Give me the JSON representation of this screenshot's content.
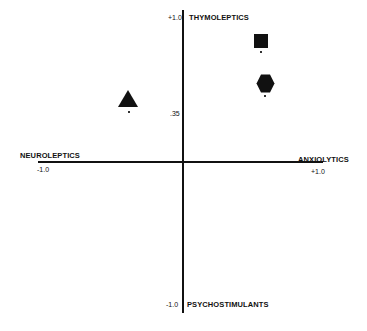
{
  "diagram": {
    "axes": {
      "top_label": "THYMOLEPTICS",
      "bottom_label": "PSYCHOSTIMULANTS",
      "left_label": "NEUROLEPTICS",
      "right_label": "ANXIOLYTICS",
      "top_tick": "+1.0",
      "bottom_tick": "-1.0",
      "left_tick": "-1.0",
      "right_tick": "+1.0",
      "mid_tick": ".35"
    },
    "markers": [
      {
        "shape": "triangle",
        "quadrant": "upper-left",
        "x": -0.39,
        "y": 0.45
      },
      {
        "shape": "square",
        "quadrant": "upper-right",
        "x": 0.55,
        "y": 0.83
      },
      {
        "shape": "hexagon",
        "quadrant": "upper-right",
        "x": 0.58,
        "y": 0.53
      }
    ],
    "colors": {
      "ink": "#111111",
      "background": "#ffffff"
    }
  }
}
